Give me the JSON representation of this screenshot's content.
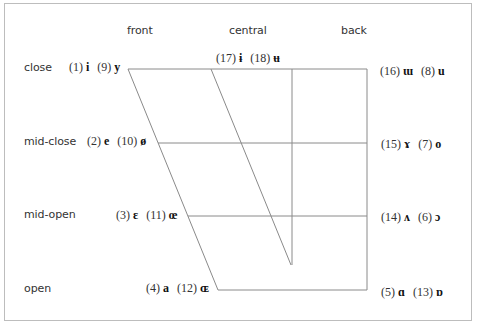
{
  "diagram": {
    "column_headers": {
      "front": "front",
      "central": "central",
      "back": "back"
    },
    "row_labels": {
      "close": "close",
      "mid_close": "mid-close",
      "mid_open": "mid-open",
      "open": "open"
    },
    "vowels": {
      "close_front": {
        "n1": "(1)",
        "s1": "i",
        "n2": "(9)",
        "s2": "y"
      },
      "close_central": {
        "n1": "(17)",
        "s1": "ɨ",
        "n2": "(18)",
        "s2": "ʉ"
      },
      "close_back": {
        "n1": "(16)",
        "s1": "ɯ",
        "n2": "(8)",
        "s2": "u"
      },
      "midclose_front": {
        "n1": "(2)",
        "s1": "e",
        "n2": "(10)",
        "s2": "ø"
      },
      "midclose_back": {
        "n1": "(15)",
        "s1": "ɤ",
        "n2": "(7)",
        "s2": "o"
      },
      "midopen_front": {
        "n1": "(3)",
        "s1": "ɛ",
        "n2": "(11)",
        "s2": "œ"
      },
      "midopen_back": {
        "n1": "(14)",
        "s1": "ʌ",
        "n2": "(6)",
        "s2": "ɔ"
      },
      "open_front": {
        "n1": "(4)",
        "s1": "a",
        "n2": "(12)",
        "s2": "ɶ"
      },
      "open_back": {
        "n1": "(5)",
        "s1": "ɑ",
        "n2": "(13)",
        "s2": "ɒ"
      }
    },
    "colors": {
      "frame": "#bdbdbd",
      "lines": "#8a8a8a",
      "text": "#333333"
    }
  }
}
